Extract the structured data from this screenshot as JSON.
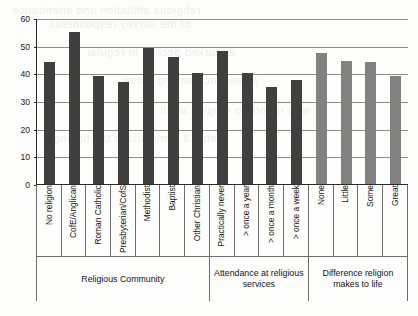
{
  "chart_data": {
    "type": "bar",
    "title": "",
    "xlabel": "",
    "ylabel": "",
    "ylim": [
      0,
      60
    ],
    "ytick_values": [
      0,
      10,
      20,
      30,
      40,
      50,
      60
    ],
    "ytick_labels": [
      "0",
      "10",
      "20",
      "30",
      "40",
      "50",
      "60"
    ],
    "grid": true,
    "legend": "none",
    "categories": [
      "No religion",
      "CofE/Anglican",
      "Roman Catholic",
      "Presbyterian/CofS",
      "Methodist",
      "Baptist",
      "Other Christian",
      "Practically never",
      "> once a year",
      "> once a month",
      "> once a week",
      "None",
      "Little",
      "Some",
      "Great"
    ],
    "values": [
      44,
      55,
      39,
      37,
      49,
      46,
      40,
      48,
      40,
      35,
      37.5,
      47.5,
      44.5,
      44,
      39
    ],
    "bar_colors": [
      "#3f3f3f",
      "#3f3f3f",
      "#3f3f3f",
      "#3f3f3f",
      "#3f3f3f",
      "#3f3f3f",
      "#3f3f3f",
      "#3f3f3f",
      "#3f3f3f",
      "#3f3f3f",
      "#3f3f3f",
      "#828282",
      "#828282",
      "#828282",
      "#828282"
    ],
    "groups": [
      {
        "label": "Religious Community",
        "count": 7
      },
      {
        "label": "Attendance at religious services",
        "count": 4
      },
      {
        "label": "Difference religion makes to life",
        "count": 4
      }
    ]
  },
  "colors": {
    "bar_dark": "#3f3f3f",
    "bar_light": "#828282",
    "axis": "#2a2a2a",
    "grid": "#8e8e8e",
    "table_border": "#6d6d6d",
    "background": "#fdfdfb"
  },
  "bleed_text": [
    "rehgious affiliation and attendance",
    "of the survey respondents",
    "a marked decline in regular",
    "attendance among those",
    "who report no religion at all",
    "Table 3 summarises the findings"
  ]
}
